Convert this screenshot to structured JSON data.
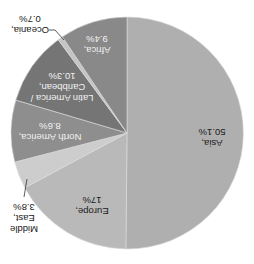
{
  "chart_data": {
    "type": "pie",
    "title": "",
    "rotation_deg": 180,
    "center": [
      127,
      133
    ],
    "radius": 116,
    "start_angle_deg": 0,
    "direction": "clockwise",
    "categories": [
      "Asia",
      "Europe",
      "Middle East",
      "North America",
      "Latin America / Caribbean",
      "Oceania",
      "Africa"
    ],
    "values": [
      50.1,
      17.0,
      3.8,
      8.6,
      10.3,
      0.7,
      9.4
    ],
    "unit": "%",
    "colors": [
      "#afafaf",
      "#b9b9b9",
      "#cdcdcd",
      "#8e8e8e",
      "#757575",
      "#c4c4c4",
      "#898989"
    ],
    "labels": [
      {
        "name": "Asia",
        "lines": [
          "Asia,",
          "50.1%"
        ],
        "pos": [
          212,
          138
        ],
        "light": false,
        "outside": false
      },
      {
        "name": "Europe",
        "lines": [
          "Europe,",
          "17%"
        ],
        "pos": [
          92,
          206
        ],
        "light": false,
        "outside": false
      },
      {
        "name": "Middle East",
        "lines": [
          "Middle",
          "East,",
          "3.8%"
        ],
        "pos": [
          24,
          218
        ],
        "light": false,
        "outside": true,
        "leader": [
          [
            27,
            179
          ],
          [
            24,
            197
          ]
        ]
      },
      {
        "name": "North America",
        "lines": [
          "North America,",
          "8.6%"
        ],
        "pos": [
          50,
          132
        ],
        "light": true,
        "outside": false
      },
      {
        "name": "Latin America / Caribbean",
        "lines": [
          "Latin America /",
          "Caribbean,",
          "10.3%"
        ],
        "pos": [
          62,
          87
        ],
        "light": true,
        "outside": false
      },
      {
        "name": "Oceania",
        "lines": [
          "Oceania,",
          "0.7%"
        ],
        "pos": [
          30,
          25
        ],
        "light": false,
        "outside": true,
        "leader": [
          [
            49,
            30
          ],
          [
            55,
            30
          ],
          [
            64,
            40
          ]
        ]
      },
      {
        "name": "Africa",
        "lines": [
          "Africa,",
          "9.4%"
        ],
        "pos": [
          97,
          45
        ],
        "light": true,
        "outside": false
      }
    ]
  }
}
